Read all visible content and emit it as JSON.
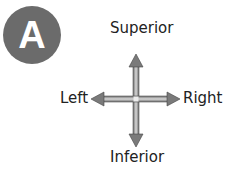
{
  "badge": {
    "letter": "A",
    "color": "#6b6b6b"
  },
  "directions": {
    "top": "Superior",
    "bottom": "Inferior",
    "left": "Left",
    "right": "Right"
  },
  "arrow_color": "#8a8a8a"
}
